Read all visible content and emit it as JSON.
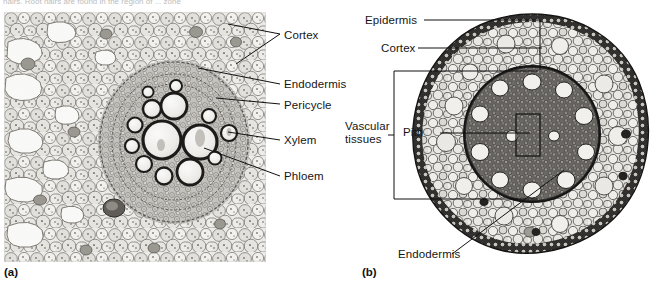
{
  "figure": {
    "top_cut_text": "hairs. Root hairs are found in the region of ... zone",
    "panels": [
      {
        "id": "a",
        "caption": "(a)",
        "description": "light micrograph of a root cross section showing cortex, endodermis, pericycle, xylem and phloem"
      },
      {
        "id": "b",
        "caption": "(b)",
        "description": "whole root cross section showing epidermis, cortex, endodermis, vascular tissues and pith"
      }
    ]
  },
  "panel_a": {
    "caption": "(a)",
    "labels": [
      {
        "id": "cortex",
        "text": "Cortex"
      },
      {
        "id": "endodermis",
        "text": "Endodermis"
      },
      {
        "id": "pericycle",
        "text": "Pericycle"
      },
      {
        "id": "xylem",
        "text": "Xylem"
      },
      {
        "id": "phloem",
        "text": "Phloem"
      }
    ]
  },
  "panel_b": {
    "caption": "(b)",
    "labels": [
      {
        "id": "epidermis",
        "text": "Epidermis"
      },
      {
        "id": "cortex",
        "text": "Cortex"
      },
      {
        "id": "vascular_tissues",
        "text": "Vascular\ntissues"
      },
      {
        "id": "pith",
        "text": "Pith"
      },
      {
        "id": "endodermis",
        "text": "Endodermis"
      }
    ]
  },
  "colors": {
    "background": "#ffffff",
    "ink": "#111111",
    "tissue_light": "#e8e7e3",
    "tissue_mid": "#b9b7b1",
    "stele_dark": "#4a4845",
    "endodermis_ring": "#2d2b29"
  }
}
